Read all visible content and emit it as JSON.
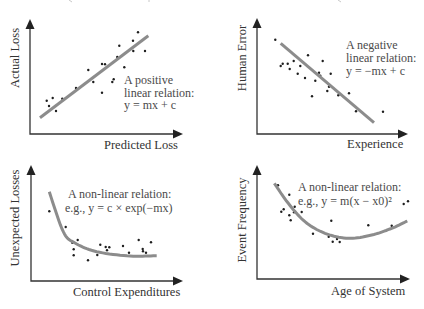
{
  "figure": {
    "panels": [
      {
        "id": "positive-linear",
        "xlabel": "Predicted Loss",
        "ylabel": "Actual Loss",
        "annotation": [
          "A positive",
          "linear relation:",
          "y = mx + c"
        ]
      },
      {
        "id": "negative-linear",
        "xlabel": "Experience",
        "ylabel": "Human Error",
        "annotation": [
          "A negative",
          "linear relation:",
          "y = −mx + c"
        ]
      },
      {
        "id": "exponential-decay",
        "xlabel": "Control Expenditures",
        "ylabel": "Unexpected Losses",
        "annotation": [
          "A non-linear relation:",
          "e.g., y = c × exp(−mx)"
        ]
      },
      {
        "id": "quadratic",
        "xlabel": "Age of System",
        "ylabel": "Event Frequency",
        "annotation": [
          "A non-linear relation:",
          "e.g., y = m(x − x0)²"
        ]
      }
    ],
    "colors": {
      "axis": "#333333",
      "fit_line": "#8c8c8c",
      "points": "#1e1e1e",
      "text": "#333333"
    }
  },
  "chart_data": [
    {
      "type": "scatter",
      "title": "",
      "xlabel": "Predicted Loss",
      "ylabel": "Actual Loss",
      "grid": false,
      "legend": "none",
      "annotation": "A positive linear relation: y = mx + c",
      "x": [
        46.7,
        49,
        52.7,
        56,
        62.3,
        76,
        88.3,
        93.3,
        102,
        105,
        102,
        112.3,
        113.7,
        117.3,
        124.3,
        119.3,
        133,
        138,
        133.3,
        145
      ],
      "y": [
        100.7,
        106,
        98,
        111,
        98.7,
        88,
        70,
        82,
        64,
        64.3,
        92.7,
        82,
        79.3,
        57,
        67.3,
        45.7,
        40.7,
        32.3,
        51,
        51
      ],
      "fit": {
        "kind": "linear",
        "points": [
          [
            40,
            117.7
          ],
          [
            148.3,
            35.7
          ]
        ]
      },
      "pixel_space": {
        "origin": [
          30,
          134
        ],
        "x_end": 183,
        "y_end": 19
      }
    },
    {
      "type": "scatter",
      "title": "",
      "xlabel": "Experience",
      "ylabel": "Human Error",
      "grid": false,
      "legend": "none",
      "annotation": "A negative linear relation: y = −mx + c",
      "x": [
        275.3,
        280.7,
        282.7,
        287.7,
        289.7,
        293.7,
        297.7,
        300.3,
        305,
        308,
        312,
        315.3,
        319,
        320.3,
        322.7,
        327.3,
        329,
        330.7,
        338.3,
        349,
        356,
        383
      ],
      "y": [
        39.7,
        66,
        63.7,
        63.7,
        69,
        61,
        73.7,
        66,
        78,
        55.3,
        96.3,
        80.7,
        72.7,
        75.7,
        61,
        91,
        86.7,
        73.7,
        95.3,
        93.3,
        111.3,
        111.7
      ],
      "fit": {
        "kind": "linear",
        "points": [
          [
            280.7,
            43.3
          ],
          [
            374,
            122.7
          ]
        ]
      },
      "pixel_space": {
        "origin": [
          257,
          134
        ],
        "x_end": 408,
        "y_end": 18
      }
    },
    {
      "type": "scatter",
      "title": "",
      "xlabel": "Control Expenditures",
      "ylabel": "Unexpected Losses",
      "grid": false,
      "legend": "none",
      "annotation": "A non-linear relation: e.g., y = c × exp(−mx)",
      "x": [
        49.3,
        65.7,
        72.3,
        77.7,
        73.7,
        73.7,
        88,
        97.3,
        100.3,
        105.7,
        107,
        109.3,
        123,
        129,
        138.7,
        142.7,
        143,
        146,
        151
      ],
      "y": [
        211.3,
        227,
        242.7,
        240,
        249.3,
        255.3,
        260.3,
        255,
        244.7,
        247,
        250.3,
        247.3,
        246,
        252.7,
        240,
        249,
        251.3,
        252.7,
        242.3
      ],
      "fit": {
        "kind": "exponential-decay",
        "points": [
          [
            49.3,
            191.7
          ],
          [
            63.3,
            231.7
          ],
          [
            75,
            243
          ],
          [
            96.7,
            251.7
          ],
          [
            130,
            256
          ],
          [
            156.7,
            255.7
          ]
        ]
      },
      "pixel_space": {
        "origin": [
          31,
          281
        ],
        "x_end": 183,
        "y_end": 165
      }
    },
    {
      "type": "scatter",
      "title": "",
      "xlabel": "Age of System",
      "ylabel": "Event Frequency",
      "grid": false,
      "legend": "none",
      "annotation": "A non-linear relation: e.g., y = m(x − x0)²",
      "x": [
        278,
        289.3,
        281.3,
        283.7,
        289.3,
        290.7,
        294.7,
        294,
        301.7,
        313,
        331.3,
        328.7,
        332.7,
        337,
        339.7,
        368.3,
        391.7,
        403.7,
        408
      ],
      "y": [
        185.3,
        194.7,
        211.7,
        209.3,
        215.3,
        220.3,
        206.7,
        212.3,
        212,
        233.7,
        220.7,
        236.7,
        241.7,
        239,
        242,
        225.3,
        225.7,
        204,
        201.3
      ],
      "fit": {
        "kind": "quadratic",
        "points": [
          [
            274.3,
            183.3
          ],
          [
            288.3,
            203.3
          ],
          [
            305,
            221.7
          ],
          [
            325,
            233.3
          ],
          [
            348.3,
            238.3
          ],
          [
            371.7,
            235
          ],
          [
            391.7,
            228.3
          ],
          [
            407.3,
            221
          ]
        ]
      },
      "pixel_space": {
        "origin": [
          257,
          279
        ],
        "x_end": 410,
        "y_end": 165
      }
    }
  ]
}
